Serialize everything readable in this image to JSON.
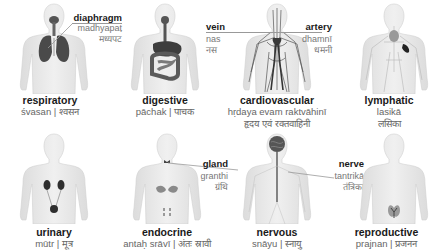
{
  "systems": [
    {
      "id": "respiratory",
      "name": "respiratory",
      "translit": "śvasan",
      "devanagari": "श्वसन"
    },
    {
      "id": "digestive",
      "name": "digestive",
      "translit": "pāchak",
      "devanagari": "पाचक"
    },
    {
      "id": "cardiovascular",
      "name": "cardiovascular",
      "translit": "hṛdaya evam raktvāhinī",
      "devanagari": "हृदय एवं रक्तवाहिनी"
    },
    {
      "id": "lymphatic",
      "name": "lymphatic",
      "translit": "lasikā",
      "devanagari": "लसिका"
    },
    {
      "id": "urinary",
      "name": "urinary",
      "translit": "mūtr",
      "devanagari": "मूत्र"
    },
    {
      "id": "endocrine",
      "name": "endocrine",
      "translit": "antaḥ srāvī",
      "devanagari": "अंतः स्रावी"
    },
    {
      "id": "nervous",
      "name": "nervous",
      "translit": "snāyu",
      "devanagari": "स्नायु"
    },
    {
      "id": "reproductive",
      "name": "reproductive",
      "translit": "prajnan",
      "devanagari": "प्रजनन"
    }
  ],
  "callouts": {
    "diaphragm": {
      "name": "diaphragm",
      "translit": "madhyapaṭ",
      "devanagari": "मध्यपट"
    },
    "vein": {
      "name": "vein",
      "translit": "nas",
      "devanagari": "नस"
    },
    "artery": {
      "name": "artery",
      "translit": "dhamnī",
      "devanagari": "धमनी"
    },
    "gland": {
      "name": "gland",
      "translit": "granthi",
      "devanagari": "ग्रंथि"
    },
    "nerve": {
      "name": "nerve",
      "translit": "tantrikā",
      "devanagari": "तंत्रिका"
    }
  },
  "captions": {
    "respiratory": "śvasan | श्वसन",
    "digestive": "pāchak | पाचक",
    "urinary": "mūtr | मूत्र",
    "endocrine": "antaḥ srāvī | अंतः स्रावी",
    "nervous": "snāyu | स्नायु",
    "reproductive": "prajnan | प्रजनन"
  },
  "colors": {
    "body": "#e6e6e6",
    "body_edge": "#d2d2d2",
    "organ": "#3a3a3a",
    "organ_mid": "#6b6b6b",
    "rule": "#999999"
  }
}
